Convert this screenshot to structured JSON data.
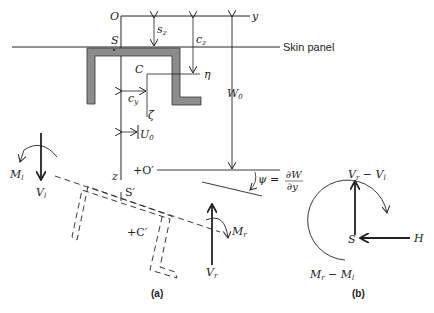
{
  "figure": {
    "panel_a": {
      "caption": "(a)",
      "labels": {
        "origin": "O",
        "y_axis": "y",
        "z_axis": "z",
        "shear_center": "S",
        "centroid": "C",
        "eta": "η",
        "zeta": "ζ",
        "s_z": "s",
        "s_z_sub": "z",
        "c_z": "c",
        "c_z_sub": "z",
        "c_y": "c",
        "c_y_sub": "y",
        "U0": "U",
        "U0_sub": "0",
        "W0": "W",
        "W0_sub": "0",
        "skin_panel": "Skin panel",
        "origin_prime": "+O′",
        "shear_center_prime": "S′",
        "centroid_prime": "+C′",
        "psi_eq": "ψ =",
        "psi_num": "∂W",
        "psi_den": "∂y",
        "M_l": "M",
        "M_l_sub": "l",
        "V_l": "V",
        "V_l_sub": "l",
        "M_r": "M",
        "M_r_sub": "r",
        "V_r": "V",
        "V_r_sub": "r"
      }
    },
    "panel_b": {
      "caption": "(b)",
      "labels": {
        "shear_force": "V",
        "shear_force_sub1": "r",
        "shear_force_mid": " − V",
        "shear_force_sub2": "l",
        "moment": "M",
        "moment_sub1": "r",
        "moment_mid": " − M",
        "moment_sub2": "l",
        "point": "S",
        "horizontal": "H"
      }
    },
    "colors": {
      "ink": "#222222",
      "section_fill": "#8c8c8c",
      "background": "#ffffff"
    }
  }
}
